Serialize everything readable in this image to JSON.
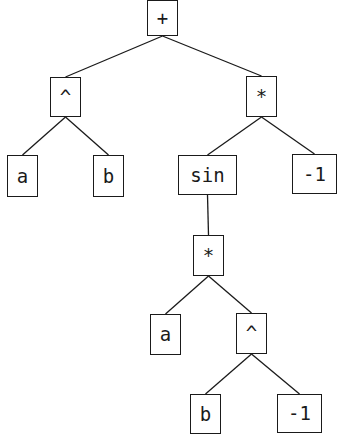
{
  "diagram": {
    "type": "expression-tree",
    "line_color": "#1a1a1a",
    "nodes": [
      {
        "id": "n0",
        "label": "+",
        "x": 147,
        "y": 0,
        "w": 31,
        "h": 36
      },
      {
        "id": "n1",
        "label": "^",
        "x": 50,
        "y": 77,
        "w": 31,
        "h": 40
      },
      {
        "id": "n2",
        "label": "*",
        "x": 246,
        "y": 76,
        "w": 31,
        "h": 41
      },
      {
        "id": "n3",
        "label": "a",
        "x": 7,
        "y": 155,
        "w": 31,
        "h": 42
      },
      {
        "id": "n4",
        "label": "b",
        "x": 93,
        "y": 155,
        "w": 31,
        "h": 42
      },
      {
        "id": "n5",
        "label": "sin",
        "x": 178,
        "y": 155,
        "w": 59,
        "h": 40
      },
      {
        "id": "n6",
        "label": "-1",
        "x": 292,
        "y": 154,
        "w": 45,
        "h": 40
      },
      {
        "id": "n7",
        "label": "*",
        "x": 193,
        "y": 235,
        "w": 31,
        "h": 41
      },
      {
        "id": "n8",
        "label": "a",
        "x": 150,
        "y": 314,
        "w": 31,
        "h": 41
      },
      {
        "id": "n9",
        "label": "^",
        "x": 236,
        "y": 313,
        "w": 31,
        "h": 41
      },
      {
        "id": "n10",
        "label": "b",
        "x": 190,
        "y": 394,
        "w": 31,
        "h": 40
      },
      {
        "id": "n11",
        "label": "-1",
        "x": 277,
        "y": 394,
        "w": 45,
        "h": 39
      }
    ],
    "edges": [
      {
        "from": "n0",
        "to": "n1"
      },
      {
        "from": "n0",
        "to": "n2"
      },
      {
        "from": "n1",
        "to": "n3"
      },
      {
        "from": "n1",
        "to": "n4"
      },
      {
        "from": "n2",
        "to": "n5"
      },
      {
        "from": "n2",
        "to": "n6"
      },
      {
        "from": "n5",
        "to": "n7"
      },
      {
        "from": "n7",
        "to": "n8"
      },
      {
        "from": "n7",
        "to": "n9"
      },
      {
        "from": "n9",
        "to": "n10"
      },
      {
        "from": "n9",
        "to": "n11"
      }
    ]
  }
}
